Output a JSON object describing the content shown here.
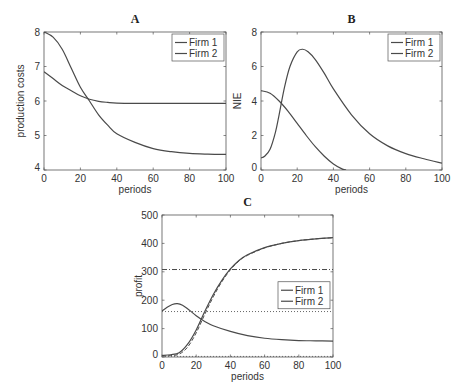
{
  "chart_data": [
    {
      "id": "A",
      "type": "line",
      "title": "A",
      "xlabel": "periods",
      "ylabel": "production costs",
      "xlim": [
        0,
        100
      ],
      "ylim": [
        4,
        8
      ],
      "xticks": [
        0,
        20,
        40,
        60,
        80,
        100
      ],
      "yticks": [
        4,
        5,
        6,
        7,
        8
      ],
      "grid": false,
      "legend_position": "upper right",
      "box": {
        "x0": 44,
        "y0": 32,
        "x1": 226,
        "y1": 170
      },
      "series": [
        {
          "name": "Firm 1",
          "color": "#4a4a4a",
          "style": "solid",
          "x": [
            0,
            5,
            10,
            15,
            20,
            25,
            30,
            35,
            40,
            50,
            60,
            70,
            80,
            90,
            100
          ],
          "y": [
            8.0,
            7.85,
            7.5,
            6.95,
            6.4,
            6.0,
            5.6,
            5.3,
            5.05,
            4.8,
            4.62,
            4.53,
            4.48,
            4.46,
            4.45
          ]
        },
        {
          "name": "Firm 2",
          "color": "#4a4a4a",
          "style": "solid",
          "x": [
            0,
            5,
            10,
            15,
            20,
            25,
            30,
            35,
            40,
            50,
            60,
            70,
            80,
            90,
            100
          ],
          "y": [
            6.85,
            6.65,
            6.45,
            6.3,
            6.15,
            6.05,
            5.99,
            5.96,
            5.94,
            5.93,
            5.93,
            5.93,
            5.93,
            5.93,
            5.93
          ]
        }
      ]
    },
    {
      "id": "B",
      "type": "line",
      "title": "B",
      "xlabel": "periods",
      "ylabel": "NIE",
      "xlim": [
        0,
        100
      ],
      "ylim": [
        0,
        8
      ],
      "xticks": [
        0,
        20,
        40,
        60,
        80,
        100
      ],
      "yticks": [
        0,
        2,
        4,
        6,
        8
      ],
      "grid": false,
      "legend_position": "upper right",
      "box": {
        "x0": 261,
        "y0": 32,
        "x1": 442,
        "y1": 170
      },
      "series": [
        {
          "name": "Firm 1",
          "color": "#4a4a4a",
          "style": "solid",
          "x": [
            0,
            2,
            5,
            8,
            10,
            13,
            16,
            20,
            23,
            26,
            30,
            35,
            40,
            50,
            60,
            70,
            80,
            90,
            100
          ],
          "y": [
            0.7,
            0.8,
            1.2,
            2.2,
            3.2,
            4.8,
            6.0,
            6.85,
            7.0,
            6.85,
            6.4,
            5.6,
            4.7,
            3.2,
            2.1,
            1.4,
            0.95,
            0.65,
            0.4
          ]
        },
        {
          "name": "Firm 2",
          "color": "#4a4a4a",
          "style": "solid",
          "x": [
            0,
            5,
            10,
            15,
            20,
            25,
            30,
            35,
            40,
            45,
            47
          ],
          "y": [
            4.6,
            4.45,
            4.0,
            3.4,
            2.7,
            2.0,
            1.35,
            0.8,
            0.35,
            0.05,
            0.0
          ]
        }
      ]
    },
    {
      "id": "C",
      "type": "line",
      "title": "C",
      "xlabel": "periods",
      "ylabel": "profit",
      "xlim": [
        0,
        100
      ],
      "ylim": [
        0,
        500
      ],
      "xticks": [
        0,
        20,
        40,
        60,
        80,
        100
      ],
      "yticks": [
        0,
        100,
        200,
        300,
        400,
        500
      ],
      "grid": false,
      "legend_position": "center right",
      "box": {
        "x0": 162,
        "y0": 215,
        "x1": 333,
        "y1": 357
      },
      "series": [
        {
          "name": "Firm 1",
          "color": "#4a4a4a",
          "style": "solid",
          "x": [
            0,
            5,
            10,
            15,
            20,
            25,
            30,
            35,
            40,
            45,
            50,
            60,
            70,
            80,
            90,
            100
          ],
          "y": [
            5,
            8,
            15,
            45,
            95,
            160,
            220,
            270,
            310,
            340,
            360,
            385,
            400,
            410,
            416,
            420
          ]
        },
        {
          "name": "Firm 2",
          "color": "#4a4a4a",
          "style": "solid",
          "x": [
            0,
            3,
            6,
            9,
            12,
            16,
            20,
            25,
            30,
            40,
            50,
            60,
            70,
            80,
            90,
            100
          ],
          "y": [
            162,
            175,
            185,
            188,
            182,
            165,
            145,
            125,
            110,
            90,
            75,
            66,
            61,
            58,
            57,
            56
          ]
        },
        {
          "name": "Firm 1 (dashed reference)",
          "color": "#4a4a4a",
          "style": "dashed",
          "legend": false,
          "x": [
            0,
            5,
            10,
            15,
            20,
            25,
            30,
            35,
            40,
            45,
            50,
            60,
            70,
            80,
            90,
            100
          ],
          "y": [
            3,
            5,
            10,
            35,
            85,
            150,
            212,
            265,
            307,
            338,
            358,
            384,
            400,
            410,
            416,
            420
          ]
        },
        {
          "name": "Horizontal dash-dot level",
          "color": "#4a4a4a",
          "style": "dashdot",
          "legend": false,
          "x": [
            0,
            100
          ],
          "y": [
            308,
            308
          ]
        },
        {
          "name": "Horizontal dotted level",
          "color": "#666666",
          "style": "dotted",
          "legend": false,
          "x": [
            0,
            100
          ],
          "y": [
            160,
            160
          ]
        },
        {
          "name": "Horizontal dotted zero level",
          "color": "#666666",
          "style": "dotted",
          "legend": false,
          "x": [
            0,
            100
          ],
          "y": [
            2,
            2
          ]
        }
      ]
    }
  ],
  "legend": {
    "labels": [
      "Firm 1",
      "Firm 2"
    ]
  }
}
